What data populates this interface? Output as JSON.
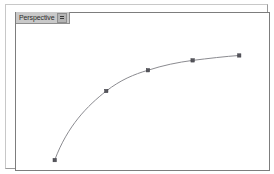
{
  "viewport": {
    "label": "Perspective",
    "menu_icon": "hamburger-menu-icon",
    "background_color": "#ffffff",
    "border_color": "#7d7d7d",
    "frame_color": "#c8c8c8",
    "label_background": "#c9c9c9",
    "active": true
  },
  "scene": {
    "object_name": "spline-curve",
    "object_type": "editable-spline",
    "curve_color": "#8a8a8f",
    "vertex_color": "#55555c",
    "vertex_count": 5,
    "vertices": [
      {
        "name": "vertex-1",
        "x": 39,
        "y": 149
      },
      {
        "name": "vertex-2",
        "x": 91,
        "y": 79
      },
      {
        "name": "vertex-3",
        "x": 133,
        "y": 58
      },
      {
        "name": "vertex-4",
        "x": 178,
        "y": 48
      },
      {
        "name": "vertex-5",
        "x": 225,
        "y": 43
      }
    ],
    "path_d": "M 39 149 C 52 114, 72 94, 91 79 C 105 68, 119 62, 133 58 C 148 53, 163 50, 178 48 C 194 46, 211 44, 225 43",
    "vertex_size": 3.4
  }
}
